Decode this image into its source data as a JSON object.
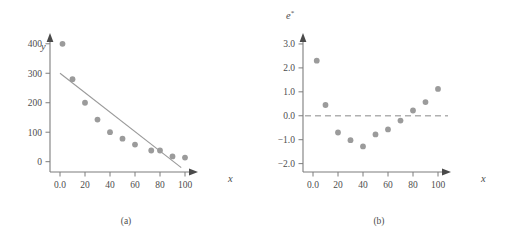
{
  "figure": {
    "panels": [
      {
        "caption": "(a)",
        "xlabel": "x",
        "ylabel": "y",
        "ylabel_sup": ""
      },
      {
        "caption": "(b)",
        "xlabel": "x",
        "ylabel": "e",
        "ylabel_sup": "*"
      }
    ],
    "colors": {
      "marker": "#9b9b9b",
      "axis": "#7d7d7d",
      "fit_line": "#9a9a9a",
      "zero_line": "#b0b0b0",
      "text": "#4d4d4d",
      "background": "#ffffff"
    }
  },
  "chart_data": [
    {
      "type": "scatter",
      "title": "(a)",
      "xlabel": "x",
      "ylabel": "y",
      "xlim": [
        -8,
        112
      ],
      "ylim": [
        -35,
        440
      ],
      "xticks": [
        0,
        20,
        40,
        60,
        80,
        100
      ],
      "xtick_labels": [
        "0.0",
        "20",
        "40",
        "60",
        "80",
        "100"
      ],
      "yticks": [
        0,
        100,
        200,
        300,
        400
      ],
      "ytick_labels": [
        "0",
        "100",
        "200",
        "300",
        "400"
      ],
      "grid": false,
      "legend": "none",
      "x": [
        2,
        10,
        20,
        30,
        40,
        50,
        60,
        73,
        80,
        90,
        100
      ],
      "y": [
        400,
        280,
        200,
        143,
        100,
        78,
        58,
        38,
        38,
        18,
        14
      ],
      "fit_line": {
        "label": "least-squares line",
        "x": [
          0,
          97
        ],
        "y": [
          300,
          -20
        ],
        "intercept": 300,
        "slope": -3.3
      }
    },
    {
      "type": "scatter",
      "title": "(b)",
      "xlabel": "x",
      "ylabel": "e*",
      "xlim": [
        -8,
        112
      ],
      "ylim": [
        -2.35,
        3.5
      ],
      "xticks": [
        0,
        20,
        40,
        60,
        80,
        100
      ],
      "xtick_labels": [
        "0.0",
        "20",
        "40",
        "60",
        "80",
        "100"
      ],
      "yticks": [
        -2.0,
        -1.0,
        0.0,
        1.0,
        2.0,
        3.0
      ],
      "ytick_labels": [
        "-2.0",
        "-1.0",
        "0.0",
        "1.0",
        "2.0",
        "3.0"
      ],
      "grid": false,
      "legend": "none",
      "x": [
        3,
        10,
        20,
        30,
        40,
        50,
        60,
        70,
        80,
        90,
        100
      ],
      "y": [
        2.3,
        0.45,
        -0.7,
        -1.02,
        -1.28,
        -0.78,
        -0.57,
        -0.2,
        0.22,
        0.57,
        1.12
      ],
      "reference_line": {
        "label": "zero reference",
        "y": 0.0,
        "style": "dashed"
      }
    }
  ]
}
